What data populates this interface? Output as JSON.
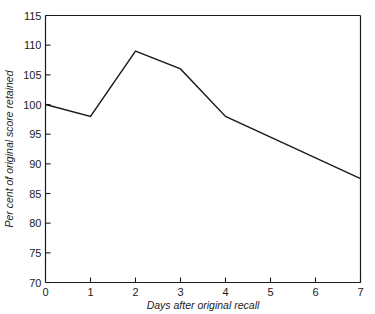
{
  "chart_data": {
    "type": "line",
    "title": "",
    "subtitle": "",
    "xlabel": "Days after original recall",
    "ylabel": "Per cent of original score retained",
    "xlim": [
      0,
      7
    ],
    "ylim": [
      70,
      115
    ],
    "xticks": [
      0,
      1,
      2,
      3,
      4,
      5,
      6,
      7
    ],
    "xtick_labels": [
      "0",
      "1",
      "2",
      "3",
      "4",
      "5",
      "6",
      "7"
    ],
    "yticks": [
      70,
      75,
      80,
      85,
      90,
      95,
      100,
      105,
      110,
      115
    ],
    "ytick_labels": [
      "70",
      "75",
      "80",
      "85",
      "90",
      "95",
      "100",
      "105",
      "110",
      "115"
    ],
    "grid": false,
    "legend": null,
    "legend_position": "none",
    "line_color": "#1a1a1a",
    "line_width": 1.4,
    "markers": false,
    "x": [
      0,
      1,
      2,
      3,
      4,
      5,
      6,
      7
    ],
    "values": [
      100,
      98,
      109,
      106,
      98,
      94.5,
      91,
      87.5
    ],
    "series": [
      {
        "name": "Per cent of original score retained",
        "x": [
          0,
          1,
          2,
          3,
          4,
          5,
          6,
          7
        ],
        "values": [
          100,
          98,
          109,
          106,
          98,
          94.5,
          91,
          87.5
        ]
      }
    ],
    "annotations": [],
    "frame": {
      "top_spine": true,
      "right_spine": true,
      "bottom_spine": true,
      "left_spine": true,
      "tick_direction": "in"
    }
  }
}
